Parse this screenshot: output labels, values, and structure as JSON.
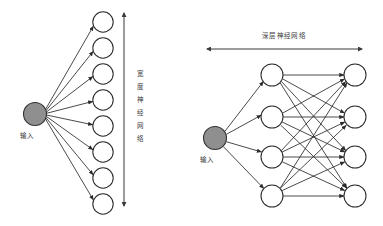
{
  "figure": {
    "background_color": "#ffffff",
    "stroke_color": "#2b2b2b",
    "input_node_color": "#8f8f8f",
    "node_fill_color": "#ffffff",
    "label_color": "#3a3a3a",
    "width": 383,
    "height": 226
  },
  "left_panel": {
    "name": "wide-neural-network",
    "input_label": "输入",
    "annotation_label": "宽度神经网络",
    "annotation_label_chars": [
      "宽",
      "度",
      "神",
      "经",
      "网",
      "络"
    ],
    "annotation_orientation": "vertical",
    "annotation_arrow": "double-headed-vertical",
    "input_node": {
      "cx": 35,
      "cy": 114,
      "r": 11.5
    },
    "output_nodes": [
      {
        "cx": 103,
        "cy": 22,
        "r": 10.2
      },
      {
        "cx": 103,
        "cy": 48,
        "r": 10.2
      },
      {
        "cx": 103,
        "cy": 74,
        "r": 10.2
      },
      {
        "cx": 103,
        "cy": 100,
        "r": 10.2
      },
      {
        "cx": 103,
        "cy": 126,
        "r": 10.2
      },
      {
        "cx": 103,
        "cy": 152,
        "r": 10.2
      },
      {
        "cx": 103,
        "cy": 178,
        "r": 10.2
      },
      {
        "cx": 103,
        "cy": 204,
        "r": 10.2
      }
    ],
    "node_count": 8,
    "arrow_axis": {
      "x": 124,
      "y_top": 13,
      "y_bottom": 206
    }
  },
  "right_panel": {
    "name": "deep-neural-network",
    "input_label": "输入",
    "annotation_label": "深层神经网络",
    "annotation_orientation": "horizontal",
    "annotation_arrow": "double-headed-horizontal",
    "input_node": {
      "cx": 215,
      "cy": 138,
      "r": 11.5
    },
    "hidden_nodes": [
      {
        "cx": 272,
        "cy": 75,
        "r": 11.0
      },
      {
        "cx": 272,
        "cy": 117,
        "r": 11.0
      },
      {
        "cx": 272,
        "cy": 157,
        "r": 11.0
      },
      {
        "cx": 272,
        "cy": 196,
        "r": 11.0
      }
    ],
    "output_nodes": [
      {
        "cx": 355,
        "cy": 75,
        "r": 11.0
      },
      {
        "cx": 355,
        "cy": 117,
        "r": 11.0
      },
      {
        "cx": 355,
        "cy": 157,
        "r": 11.0
      },
      {
        "cx": 355,
        "cy": 196,
        "r": 11.0
      }
    ],
    "hidden_count": 4,
    "output_count": 4,
    "arrow_axis": {
      "y": 49,
      "x_left": 207,
      "x_right": 362
    }
  }
}
